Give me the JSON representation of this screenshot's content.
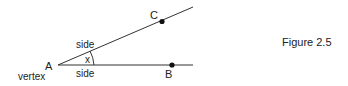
{
  "diagram": {
    "vertex_label": "A",
    "vertex_caption": "vertex",
    "point_c": "C",
    "point_b": "B",
    "side_top": "side",
    "side_bottom": "side",
    "angle_label": "x",
    "line_color": "#333333"
  },
  "caption": "Figure 2.5"
}
